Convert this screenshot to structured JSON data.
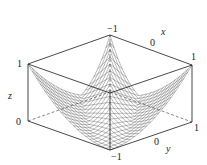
{
  "chart_data": {
    "type": "surface",
    "title": "",
    "xlabel": "x",
    "ylabel": "y",
    "zlabel": "z",
    "xlim": [
      -1,
      1
    ],
    "ylim": [
      -1,
      1
    ],
    "zlim": [
      0,
      1
    ],
    "x_ticks": [
      "-1",
      "0",
      "1"
    ],
    "y_ticks": [
      "-1",
      "0",
      "1"
    ],
    "z_ticks": [
      "0",
      "1"
    ],
    "grid_resolution": 21,
    "corner_heights": {
      "x=-1,y=-1": 1,
      "x=1,y=1": 1,
      "x=-1,y=1": 1,
      "x=1,y=-1": 0
    },
    "grid": false,
    "legend": false
  },
  "labels": {
    "z_top": "1",
    "z_bottom": "0",
    "z_axis": "z",
    "x_min": "−1",
    "x_mid": "0",
    "x_max": "1",
    "x_axis": "x",
    "y_min": "−1",
    "y_mid": "0",
    "y_max": "1",
    "y_axis": "y"
  }
}
